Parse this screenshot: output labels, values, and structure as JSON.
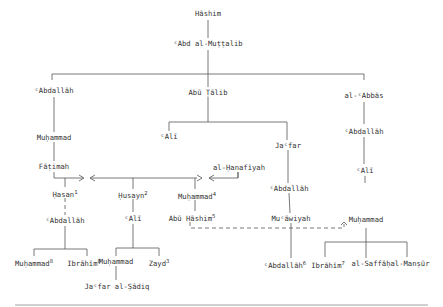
{
  "nodes": {
    "hashim": {
      "label": "Hāshim"
    },
    "abd_al_muttalib": {
      "label": "ᶜAbd al-Muṭṭalib"
    },
    "abdallah_1": {
      "label": "ᶜAbdallāh"
    },
    "muhammad_prophet": {
      "label": "Muḥammad"
    },
    "fatimah": {
      "label": "Fāṭimah"
    },
    "hasan": {
      "label": "Ḥasan",
      "note": "1"
    },
    "abdallah_hasan": {
      "label": "ᶜAbdallāh"
    },
    "muhammad_8": {
      "label": "Muḥammad",
      "note": "8"
    },
    "ibrahim_8": {
      "label": "Ibrāhīm",
      "note": "8"
    },
    "abu_talib": {
      "label": "Abū Ṭālib"
    },
    "ali": {
      "label": "ᶜAlī"
    },
    "husayn": {
      "label": "Ḥusayn",
      "note": "2"
    },
    "ali_husayn": {
      "label": "ᶜAlī"
    },
    "muhammad_baqir": {
      "label": "Muḥammad"
    },
    "zayd": {
      "label": "Zayd",
      "note": "3"
    },
    "jafar_sadiq": {
      "label": "Jaᶜfar al-Ṣādiq"
    },
    "al_hanafiyah": {
      "label": "al-Ḥanafīyah"
    },
    "muhammad_4": {
      "label": "Muḥammad",
      "note": "4"
    },
    "abu_hashim": {
      "label": "Abū Hāshim",
      "note": "5"
    },
    "jafar": {
      "label": "Jaᶜfar"
    },
    "abdallah_jafar": {
      "label": "ᶜAbdallāh"
    },
    "muawiyah": {
      "label": "Muᶜāwiyah"
    },
    "abdallah_6": {
      "label": "ᶜAbdallāh",
      "note": "6"
    },
    "al_abbas": {
      "label": "al-ᶜAbbās"
    },
    "abdallah_abbas": {
      "label": "ᶜAbdallāh"
    },
    "ali_abbas": {
      "label": "ᶜAlī"
    },
    "muhammad_abbasid": {
      "label": "Muḥammad"
    },
    "ibrahim_7": {
      "label": "Ibrāhīm",
      "note": "7"
    },
    "al_saffah": {
      "label": "al-Saffāḥ"
    },
    "al_mansur": {
      "label": "al-Manṣūr"
    }
  }
}
